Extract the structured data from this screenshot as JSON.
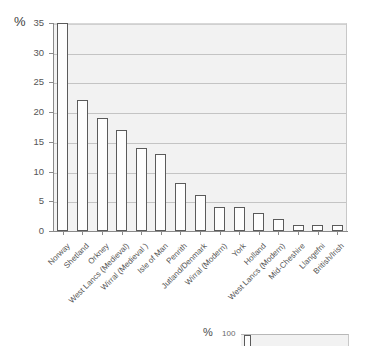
{
  "chart_data": {
    "type": "bar",
    "title": "",
    "xlabel": "",
    "ylabel": "%",
    "ylim": [
      0,
      35
    ],
    "yticks": [
      0,
      5,
      10,
      15,
      20,
      25,
      30,
      35
    ],
    "grid": true,
    "legend": "none",
    "categories": [
      "Norway",
      "Shetland",
      "Orkney",
      "West Lancs (Medieval)",
      "Wirral (Medieval )",
      "Isle of Man",
      "Penrith",
      "Jutland/Denmark",
      "Wirral (Modern)",
      "York",
      "Holland",
      "West Lancs (Modern)",
      "Mid-Cheshire",
      "Llangefni",
      "British/Irish"
    ],
    "values": [
      35,
      22,
      19,
      17,
      14,
      13,
      8,
      6,
      4,
      4,
      3,
      2,
      1,
      1,
      1
    ]
  },
  "axis": {
    "y_unit_label": "%",
    "tick_labels": [
      "35",
      "30",
      "25",
      "20",
      "15",
      "10",
      "5",
      "0"
    ]
  },
  "second_chart_fragment": {
    "unit_label": "%",
    "tick_label": "100"
  },
  "colors": {
    "bar_fill": "#fdfdfd",
    "bar_outline": "#5a5a5a",
    "plot_background": "#f2f2f2",
    "gridline": "#c4c4c4",
    "axis_line": "#8a8a8a",
    "text": "#555555"
  }
}
